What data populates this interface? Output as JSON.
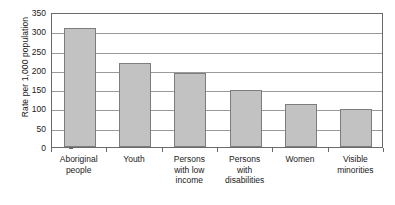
{
  "chart_data": {
    "type": "bar",
    "title": "",
    "xlabel": "",
    "ylabel": "Rate per 1,000 population",
    "categories": [
      "Aboriginal people",
      "Youth",
      "Persons with low income",
      "Persons with disabilities",
      "Women",
      "Visible minorities"
    ],
    "category_lines": [
      [
        "Aboriginal",
        "people"
      ],
      [
        "Youth"
      ],
      [
        "Persons",
        "with low",
        "income"
      ],
      [
        "Persons",
        "with",
        "disabilities"
      ],
      [
        "Women"
      ],
      [
        "Visible",
        "minorities"
      ]
    ],
    "values": [
      308,
      218,
      192,
      148,
      112,
      98
    ],
    "ylim": [
      0,
      350
    ],
    "ytick_step": 50,
    "yticks": [
      0,
      50,
      100,
      150,
      200,
      250,
      300,
      350
    ],
    "ytick_labels": [
      "0",
      "50",
      "100",
      "150",
      "200",
      "250",
      "300",
      "350"
    ],
    "grid": true,
    "grid_axis": "y",
    "legend": false,
    "legend_position": "none",
    "colors": {
      "bar_fill": "#c2c2c2",
      "bar_border": "#7d7d7d",
      "gridline": "#9a9a9a",
      "axis": "#6a6a6a",
      "text": "#1a1a1a",
      "background": "#ffffff"
    }
  }
}
